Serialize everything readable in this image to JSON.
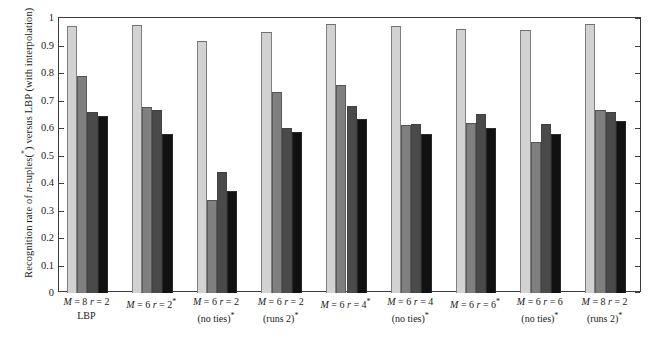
{
  "chart_data": {
    "type": "bar",
    "title": "",
    "xlabel": "",
    "ylabel": "Recognition rate of n-tuples(*) versus LBP (with interpolation)",
    "ylim": [
      0,
      1
    ],
    "grid": false,
    "legend_position": "none",
    "y_ticks": [
      "0",
      "0.1",
      "0.2",
      "0.3",
      "0.4",
      "0.5",
      "0.6",
      "0.7",
      "0.8",
      "0.9",
      "1"
    ],
    "y_tick_values": [
      0,
      0.1,
      0.2,
      0.3,
      0.4,
      0.5,
      0.6,
      0.7,
      0.8,
      0.9,
      1
    ],
    "categories": [
      "M = 8 r = 2 LBP",
      "M = 6 r = 2*",
      "M = 6 r = 2 (no ties)*",
      "M = 6 r = 2 (runs 2)*",
      "M = 6 r = 4*",
      "M = 6 r = 4 (no ties)*",
      "M = 6 r = 6*",
      "M = 6 r = 6 (no ties)*",
      "M = 8 r = 2 (runs 2)*"
    ],
    "series": [
      {
        "name": "series-1",
        "color": "#d2d2d2",
        "values": [
          0.97,
          0.975,
          0.915,
          0.95,
          0.98,
          0.97,
          0.96,
          0.955,
          0.98
        ]
      },
      {
        "name": "series-2",
        "color": "#7f7f7f",
        "values": [
          0.79,
          0.675,
          0.34,
          0.73,
          0.755,
          0.61,
          0.618,
          0.55,
          0.665
        ]
      },
      {
        "name": "series-3",
        "color": "#4a4a4a",
        "values": [
          0.66,
          0.665,
          0.44,
          0.6,
          0.68,
          0.615,
          0.65,
          0.613,
          0.66
        ]
      },
      {
        "name": "series-4",
        "color": "#111111",
        "values": [
          0.642,
          0.578,
          0.37,
          0.585,
          0.632,
          0.578,
          0.6,
          0.578,
          0.625
        ]
      }
    ]
  },
  "axis": {
    "y_title_parts": {
      "pre": "Recognition rate of ",
      "italic": "n",
      "mid": "-tuples(",
      "star": "*",
      "post": ") versus LBP (with interpolation)"
    }
  },
  "x_groups": [
    {
      "line1_m": "M",
      "line1_eq1": " = 8 ",
      "line1_r": "r",
      "line1_eq2": " = 2",
      "line1_star": "",
      "line2": "LBP"
    },
    {
      "line1_m": "M",
      "line1_eq1": " = 6 ",
      "line1_r": "r",
      "line1_eq2": " = 2",
      "line1_star": "*",
      "line2": ""
    },
    {
      "line1_m": "M",
      "line1_eq1": " = 6 ",
      "line1_r": "r",
      "line1_eq2": " = 2",
      "line1_star": "",
      "line2": "(no ties)*"
    },
    {
      "line1_m": "M",
      "line1_eq1": " = 6 ",
      "line1_r": "r",
      "line1_eq2": " = 2",
      "line1_star": "",
      "line2": "(runs 2)*"
    },
    {
      "line1_m": "M",
      "line1_eq1": " = 6 ",
      "line1_r": "r",
      "line1_eq2": " = 4",
      "line1_star": "*",
      "line2": ""
    },
    {
      "line1_m": "M",
      "line1_eq1": " = 6 ",
      "line1_r": "r",
      "line1_eq2": " = 4",
      "line1_star": "",
      "line2": "(no ties)*"
    },
    {
      "line1_m": "M",
      "line1_eq1": " = 6 ",
      "line1_r": "r",
      "line1_eq2": " = 6",
      "line1_star": "*",
      "line2": ""
    },
    {
      "line1_m": "M",
      "line1_eq1": " = 6 ",
      "line1_r": "r",
      "line1_eq2": " = 6",
      "line1_star": "",
      "line2": "(no ties)*"
    },
    {
      "line1_m": "M",
      "line1_eq1": " = 8 ",
      "line1_r": "r",
      "line1_eq2": " = 2",
      "line1_star": "",
      "line2": "(runs 2)*"
    }
  ]
}
